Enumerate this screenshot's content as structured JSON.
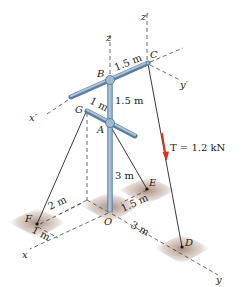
{
  "figure": {
    "colors": {
      "pole": "#8fb0cc",
      "pole_edge": "#5a7d9c",
      "cable": "#222222",
      "dash": "#444444",
      "arrow": "#e0321e",
      "shadow": "#b09484"
    },
    "points": {
      "A": "A",
      "B": "B",
      "C": "C",
      "D": "D",
      "E": "E",
      "F": "F",
      "G": "G",
      "O": "O"
    },
    "axes": {
      "x": "x",
      "y": "y",
      "z": "z",
      "x_prime": "x′",
      "y_prime": "y′",
      "z_prime": "z′"
    },
    "dimensions": {
      "BC": "1.5 m",
      "AB": "1.5 m",
      "GA": "1 m",
      "OA": "3 m",
      "F_to_x": "2 m",
      "F_offset": "1 m",
      "OE": "1.5 m",
      "OD": "3 m"
    },
    "force": {
      "label": "T = 1.2 kN"
    }
  }
}
